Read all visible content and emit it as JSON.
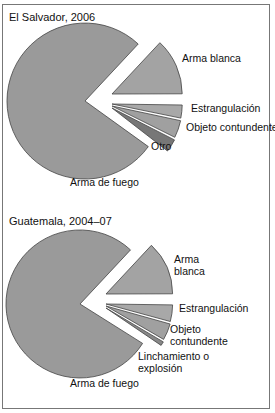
{
  "chart_data": [
    {
      "type": "pie",
      "title": "El Salvador, 2006",
      "exploded": true,
      "slices": [
        {
          "label": "Arma de fuego",
          "value": 77,
          "color": "#9a9a9a"
        },
        {
          "label": "Arma blanca",
          "value": 13,
          "color": "#a3a3a3"
        },
        {
          "label": "Estrangulación",
          "value": 3,
          "color": "#a8a8a8"
        },
        {
          "label": "Objeto contundente",
          "value": 4,
          "color": "#a0a0a0"
        },
        {
          "label": "Otro",
          "value": 3,
          "color": "#777777"
        }
      ]
    },
    {
      "type": "pie",
      "title": "Guatemala, 2004–07",
      "exploded": true,
      "slices": [
        {
          "label": "Arma de fuego",
          "value": 78,
          "color": "#9a9a9a"
        },
        {
          "label": "Arma blanca",
          "value": 13,
          "color": "#a3a3a3"
        },
        {
          "label": "Estrangulación",
          "value": 4,
          "color": "#a8a8a8"
        },
        {
          "label": "Objeto contundente",
          "value": 4,
          "color": "#a0a0a0"
        },
        {
          "label": "Linchamiento o explosión",
          "value": 1,
          "color": "#888888"
        }
      ]
    }
  ],
  "panels": {
    "top": {
      "title": "El Salvador, 2006"
    },
    "bottom": {
      "title": "Guatemala, 2004–07"
    }
  }
}
